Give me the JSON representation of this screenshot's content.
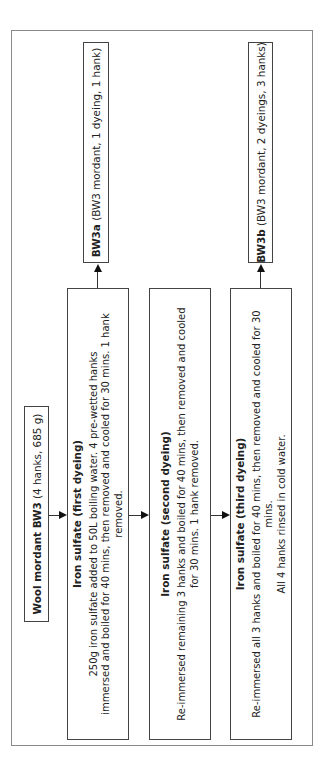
{
  "diagram": {
    "source": {
      "name": "Wool mordant BW3",
      "detail": " (4 hanks, 685 g)"
    },
    "steps": [
      {
        "title": "Iron sulfate (first dyeing)",
        "lines": [
          "250g iron sulfate added to 50L boiling water. 4 pre-wetted hanks",
          "immersed and boiled for 40 mins, then removed and cooled for 30 mins. 1 hank removed."
        ]
      },
      {
        "title": "Iron sulfate (second dyeing)",
        "lines": [
          "Re-immersed remaining 3 hanks and boiled for 40 mins, then removed and cooled",
          "for 30 mins. 1 hank removed."
        ]
      },
      {
        "title": "Iron sulfate (third dyeing)",
        "lines": [
          "Re-immersed all 3 hanks and boiled for 40 mins, then removed and cooled for 30 mins.",
          "All 4 hanks rinsed in cold water."
        ]
      }
    ],
    "outputs": [
      {
        "name": "BW3a",
        "detail": " (BW3 mordant, 1 dyeing, 1 hank)"
      },
      {
        "name": "BW3b",
        "detail": " (BW3 mordant, 2 dyeings, 3 hanks)"
      }
    ],
    "colors": {
      "border": "#444444",
      "outer_border": "#8a8a8a",
      "arrow": "#111111"
    }
  }
}
